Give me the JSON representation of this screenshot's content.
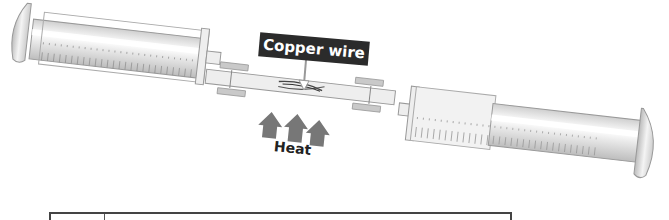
{
  "diagram": {
    "labels": {
      "copper_wire": "Copper wire",
      "heat": "Heat"
    },
    "components": [
      {
        "name": "left-syringe",
        "description": "Gas syringe with graduated scale, plunger pushed in on left"
      },
      {
        "name": "connecting-tube",
        "description": "Glass tube containing copper wire, joined with rubber connectors"
      },
      {
        "name": "right-syringe",
        "description": "Gas syringe with graduated scale, plunger on right"
      },
      {
        "name": "heat-arrows",
        "count": 3
      }
    ],
    "colors": {
      "label_bg": "#2b2b2b",
      "label_text": "#ffffff",
      "arrow": "#777777",
      "syringe_body": "#e6e6e6",
      "outline": "#9a9a9a"
    }
  },
  "table": {
    "columns": [
      "",
      ""
    ]
  }
}
